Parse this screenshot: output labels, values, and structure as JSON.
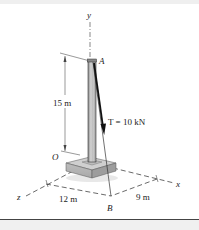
{
  "figure": {
    "labels": {
      "y_axis": "y",
      "x_axis": "x",
      "z_axis": "z",
      "point_a": "A",
      "point_b": "B",
      "origin": "O",
      "height": "15 m",
      "dist_z": "12 m",
      "dist_x": "9 m",
      "tension": "T = 10 kN"
    },
    "colors": {
      "line": "#222222",
      "post": "#b9b9b9",
      "base": "#c8c8c8",
      "dimension": "#555555",
      "background": "#ffffff",
      "footer": "#f0f0f0"
    }
  }
}
